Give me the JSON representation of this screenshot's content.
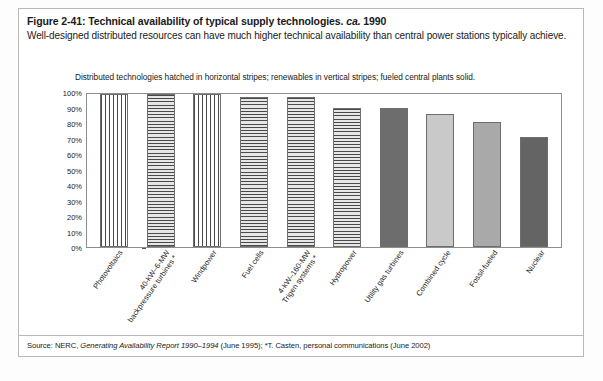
{
  "figure": {
    "title_main": "Figure 2-41: Technical availability of typical supply technologies.",
    "title_ca": "ca.",
    "title_year": "1990",
    "subtitle": "Well-designed distributed resources can have much higher technical availability than central power stations typically achieve.",
    "source": "Source: NERC, ",
    "source_italic": "Generating Availability Report 1990–1994",
    "source_rest": " (June 1995); *T. Casten, personal communications (June 2002)"
  },
  "chart_data": {
    "type": "bar",
    "subtitle": "Distributed technologies hatched in horizontal stripes; renewables in vertical stripes; fueled central plants solid.",
    "xlabel": "",
    "ylabel": "",
    "ylim": [
      0,
      100
    ],
    "ytick_values": [
      0,
      10,
      20,
      30,
      40,
      50,
      60,
      70,
      80,
      90,
      100
    ],
    "ytick_labels": [
      "0%",
      "10%",
      "20%",
      "30%",
      "40%",
      "50%",
      "60%",
      "70%",
      "80%",
      "90%",
      "100%"
    ],
    "grid": false,
    "legend": "none",
    "categories": [
      "Photovoltaics",
      "40-kW–6-MW backpressure turbines *",
      "Windpower",
      "Fuel cells",
      "4-kW–160-MW Trigen systems *",
      "Hydropower",
      "Utility gas turbines",
      "Combined cycle",
      "Fossil-fueled",
      "Nuclear"
    ],
    "values": [
      99,
      99,
      99,
      97,
      96.5,
      90,
      90,
      86,
      80.5,
      71
    ],
    "bars": [
      {
        "label_lines": [
          "Photovoltaics"
        ],
        "value": 99,
        "pattern": "vertical-stripes",
        "group": "renewable",
        "color": "#ffffff"
      },
      {
        "label_lines": [
          "40-kW–6-MW",
          "backpressure turbines *"
        ],
        "value": 99,
        "pattern": "horizontal-stripes",
        "group": "distributed",
        "color": "#ffffff"
      },
      {
        "label_lines": [
          "Windpower"
        ],
        "value": 99,
        "pattern": "vertical-stripes",
        "group": "renewable",
        "color": "#ffffff"
      },
      {
        "label_lines": [
          "Fuel cells"
        ],
        "value": 97,
        "pattern": "horizontal-stripes",
        "group": "distributed",
        "color": "#ffffff"
      },
      {
        "label_lines": [
          "4-kW–160-MW",
          "Trigen systems *"
        ],
        "value": 96.5,
        "pattern": "horizontal-stripes",
        "group": "distributed",
        "color": "#ffffff"
      },
      {
        "label_lines": [
          "Hydropower"
        ],
        "value": 90,
        "pattern": "horizontal-stripes",
        "group": "renewable",
        "color": "#ffffff"
      },
      {
        "label_lines": [
          "Utility gas turbines"
        ],
        "value": 90,
        "pattern": "solid",
        "group": "central",
        "color": "#6d6d6d"
      },
      {
        "label_lines": [
          "Combined cycle"
        ],
        "value": 86,
        "pattern": "solid",
        "group": "central",
        "color": "#c9c9c9"
      },
      {
        "label_lines": [
          "Fossil-fueled"
        ],
        "value": 80.5,
        "pattern": "solid",
        "group": "central",
        "color": "#a9a9a9"
      },
      {
        "label_lines": [
          "Nuclear"
        ],
        "value": 71,
        "pattern": "solid",
        "group": "central",
        "color": "#646464"
      }
    ]
  }
}
